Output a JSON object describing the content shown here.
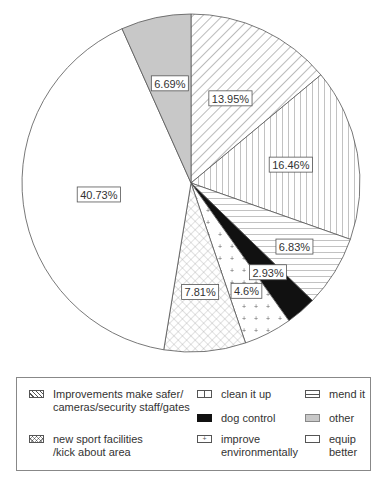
{
  "chart_data": {
    "type": "pie",
    "title": "",
    "start_angle_deg": 0,
    "direction": "clockwise",
    "slices": [
      {
        "label": "Improvements make safer/ cameras/security staff/gates",
        "value": 13.95,
        "text": "13.95%",
        "pattern": "diag-back"
      },
      {
        "label": "clean it up",
        "value": 16.46,
        "text": "16.46%",
        "pattern": "vertical"
      },
      {
        "label": "mend it",
        "value": 6.83,
        "text": "6.83%",
        "pattern": "horizontal"
      },
      {
        "label": "dog control",
        "value": 2.93,
        "text": "2.93%",
        "pattern": "solid-black"
      },
      {
        "label": "improve environmentally",
        "value": 4.6,
        "text": "4.6%",
        "pattern": "dots"
      },
      {
        "label": "new sport facilities /kick about area",
        "value": 7.81,
        "text": "7.81%",
        "pattern": "crosshatch"
      },
      {
        "label": "equip better",
        "value": 40.73,
        "text": "40.73%",
        "pattern": "white"
      },
      {
        "label": "other",
        "value": 6.69,
        "text": "6.69%",
        "pattern": "gray"
      }
    ],
    "legend_position": "bottom"
  },
  "legend": {
    "items": [
      {
        "line1": "Improvements make safer/",
        "line2": "cameras/security staff/gates"
      },
      {
        "line1": "new sport facilities",
        "line2": "/kick about area"
      },
      {
        "line1": "clean it up",
        "line2": ""
      },
      {
        "line1": "dog control",
        "line2": ""
      },
      {
        "line1": "improve",
        "line2": "environmentally"
      },
      {
        "line1": "mend it",
        "line2": ""
      },
      {
        "line1": "other",
        "line2": ""
      },
      {
        "line1": "equip",
        "line2": "better"
      }
    ]
  }
}
